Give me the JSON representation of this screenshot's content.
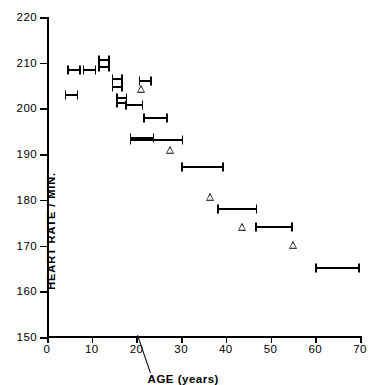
{
  "chart_data": {
    "type": "scatter",
    "title": "",
    "xlabel": "AGE (years)",
    "ylabel": "HEART RATE / MIN.",
    "xlim": [
      0,
      70
    ],
    "ylim": [
      150,
      220
    ],
    "xticks": [
      0,
      10,
      20,
      30,
      40,
      50,
      60,
      70
    ],
    "yticks": [
      150,
      160,
      170,
      180,
      190,
      200,
      210,
      220
    ],
    "xtick_labels": [
      "0",
      "10",
      "20",
      "30",
      "40",
      "50",
      "60",
      "70"
    ],
    "ytick_labels": [
      "150",
      "160",
      "170",
      "180",
      "190",
      "200",
      "210",
      "220"
    ],
    "grid": false,
    "legend": null,
    "series": [
      {
        "name": "age-range markers",
        "marker": "horizontal-range-bar",
        "points": [
          {
            "x_start": 4.0,
            "x_end": 7.0,
            "x_mid": 5.5,
            "y": 202.9
          },
          {
            "x_start": 4.5,
            "x_end": 7.5,
            "x_mid": 6.0,
            "y": 208.3
          },
          {
            "x_start": 8.0,
            "x_end": 11.0,
            "x_mid": 9.5,
            "y": 208.3
          },
          {
            "x_start": 11.5,
            "x_end": 14.0,
            "x_mid": 12.8,
            "y": 210.6
          },
          {
            "x_start": 11.5,
            "x_end": 14.0,
            "x_mid": 12.8,
            "y": 209.0
          },
          {
            "x_start": 14.5,
            "x_end": 17.0,
            "x_mid": 15.8,
            "y": 206.4
          },
          {
            "x_start": 14.5,
            "x_end": 17.0,
            "x_mid": 15.8,
            "y": 204.7
          },
          {
            "x_start": 15.5,
            "x_end": 18.0,
            "x_mid": 16.8,
            "y": 202.2
          },
          {
            "x_start": 15.5,
            "x_end": 18.0,
            "x_mid": 16.8,
            "y": 201.2
          },
          {
            "x_start": 17.5,
            "x_end": 21.5,
            "x_mid": 19.5,
            "y": 200.8
          },
          {
            "x_start": 20.5,
            "x_end": 23.5,
            "x_mid": 22.0,
            "y": 206.1
          },
          {
            "x_start": 21.5,
            "x_end": 27.0,
            "x_mid": 24.3,
            "y": 197.8
          },
          {
            "x_start": 18.5,
            "x_end": 24.0,
            "x_mid": 21.3,
            "y": 193.6
          },
          {
            "x_start": 18.5,
            "x_end": 30.5,
            "x_mid": 24.5,
            "y": 193.0
          },
          {
            "x_start": 30.0,
            "x_end": 39.5,
            "x_mid": 34.8,
            "y": 187.2
          },
          {
            "x_start": 38.0,
            "x_end": 47.0,
            "x_mid": 42.5,
            "y": 178.0
          },
          {
            "x_start": 46.5,
            "x_end": 55.0,
            "x_mid": 50.8,
            "y": 174.0
          },
          {
            "x_start": 60.0,
            "x_end": 70.0,
            "x_mid": 65.0,
            "y": 165.0
          }
        ]
      },
      {
        "name": "open-triangle points",
        "marker": "open-triangle",
        "points": [
          {
            "x": 21.0,
            "y": 204.0
          },
          {
            "x": 27.5,
            "y": 190.6
          },
          {
            "x": 36.5,
            "y": 180.3
          },
          {
            "x": 43.5,
            "y": 173.8
          },
          {
            "x": 55.0,
            "y": 170.0
          }
        ]
      }
    ]
  }
}
